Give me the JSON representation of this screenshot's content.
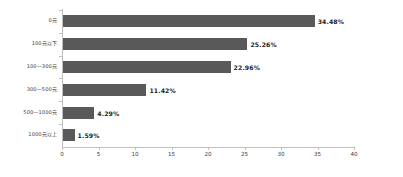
{
  "chart_data": {
    "type": "bar",
    "orientation": "horizontal",
    "title": "",
    "subtitle": "",
    "xlabel": "",
    "ylabel": "",
    "categories": [
      "0元",
      "100元以下",
      "100—300元",
      "300—500元",
      "500—1000元",
      "1000元以上"
    ],
    "values": [
      34.48,
      25.26,
      22.96,
      11.42,
      4.29,
      1.59
    ],
    "data_labels": [
      "34.48%",
      "25.26%",
      "22.96%",
      "11.42%",
      "4.29%",
      "1.59%"
    ],
    "xlim": [
      0,
      40
    ],
    "xticks": [
      0,
      5,
      10,
      15,
      20,
      25,
      30,
      35,
      40
    ],
    "xtick_labels": [
      "0",
      "5",
      "10",
      "15",
      "20",
      "25",
      "30",
      "35",
      "40"
    ],
    "grid": false,
    "legend": null,
    "bar_color": "#595959",
    "axis_color": "#bfbfbf",
    "label_color": "#404040",
    "value_label_color": "#262626",
    "background": "#ffffff"
  }
}
